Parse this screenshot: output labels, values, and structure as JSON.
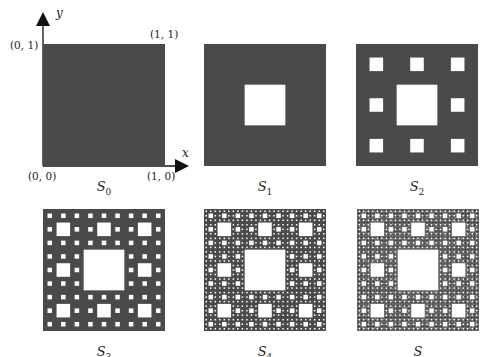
{
  "figure": {
    "fill_color": "#4a4a4a",
    "hole_color": "#ffffff",
    "axes": {
      "x_label": "x",
      "y_label": "y",
      "corner_labels": {
        "top_left": "(0, 1)",
        "top_right": "(1, 1)",
        "bottom_left": "(0, 0)",
        "bottom_right": "(1, 0)"
      }
    },
    "panels": [
      {
        "name": "S0",
        "base": "S",
        "sub": "0",
        "level": 0,
        "x": 43,
        "y": 44,
        "size": 122
      },
      {
        "name": "S1",
        "base": "S",
        "sub": "1",
        "level": 1,
        "x": 204,
        "y": 44,
        "size": 122
      },
      {
        "name": "S2",
        "base": "S",
        "sub": "2",
        "level": 2,
        "x": 356,
        "y": 44,
        "size": 122
      },
      {
        "name": "S3",
        "base": "S",
        "sub": "3",
        "level": 3,
        "x": 43,
        "y": 209,
        "size": 122
      },
      {
        "name": "S4",
        "base": "S",
        "sub": "4",
        "level": 4,
        "x": 204,
        "y": 209,
        "size": 122
      },
      {
        "name": "S",
        "base": "S",
        "sub": "",
        "level": 5,
        "x": 357,
        "y": 209,
        "size": 122
      }
    ]
  }
}
